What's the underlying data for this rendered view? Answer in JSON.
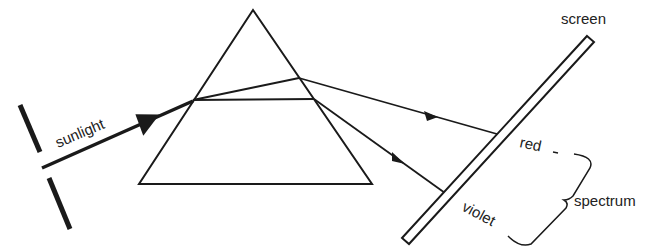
{
  "diagram": {
    "labels": {
      "sunlight": "sunlight",
      "screen": "screen",
      "red": "red",
      "violet": "violet",
      "spectrum": "spectrum"
    },
    "colors": {
      "line": "#1a1a1a",
      "background": "#ffffff"
    },
    "elements": [
      {
        "name": "slit",
        "description": "opening between two barriers"
      },
      {
        "name": "sunlight-beam",
        "description": "incident ray with arrow"
      },
      {
        "name": "prism",
        "shape": "triangle"
      },
      {
        "name": "red-ray",
        "description": "less-refracted ray"
      },
      {
        "name": "violet-ray",
        "description": "more-refracted ray"
      },
      {
        "name": "screen",
        "description": "tilted screen"
      },
      {
        "name": "spectrum-brace",
        "description": "curly brace spanning red to violet"
      }
    ]
  }
}
